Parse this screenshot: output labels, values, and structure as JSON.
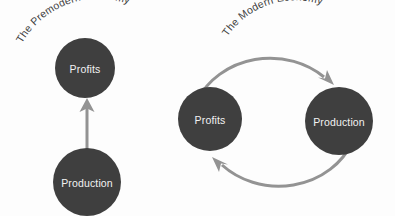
{
  "canvas": {
    "width": 395,
    "height": 216,
    "background_color": "#fdfdfd"
  },
  "theme": {
    "node_fill": "#3f3f3f",
    "node_text_color": "#f2f2f2",
    "arrow_color": "#939393",
    "title_color": "#3d3d3d"
  },
  "diagrams": [
    {
      "id": "premodern",
      "title": "The Premodern Economy",
      "type": "linear-flow",
      "nodes": [
        {
          "id": "premodern-profits",
          "label": "Profits"
        },
        {
          "id": "premodern-production",
          "label": "Production"
        }
      ],
      "edges": [
        {
          "from": "Production",
          "to": "Profits",
          "style": "straight-arrow",
          "direction": "up"
        }
      ]
    },
    {
      "id": "modern",
      "title": "The Modern Economy",
      "type": "cycle",
      "nodes": [
        {
          "id": "modern-profits",
          "label": "Profits"
        },
        {
          "id": "modern-production",
          "label": "Production"
        }
      ],
      "edges": [
        {
          "from": "Profits",
          "to": "Production",
          "style": "curved-arrow",
          "direction": "clockwise-top"
        },
        {
          "from": "Production",
          "to": "Profits",
          "style": "curved-arrow",
          "direction": "clockwise-bottom"
        }
      ]
    }
  ]
}
